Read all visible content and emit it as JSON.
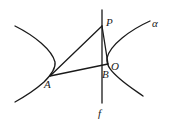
{
  "figure": {
    "labels": {
      "P": "P",
      "alpha": "α",
      "O": "O",
      "B": "B",
      "A": "A",
      "f": "f"
    },
    "colors": {
      "stroke": "#1a1a1a",
      "background": "#ffffff"
    }
  }
}
